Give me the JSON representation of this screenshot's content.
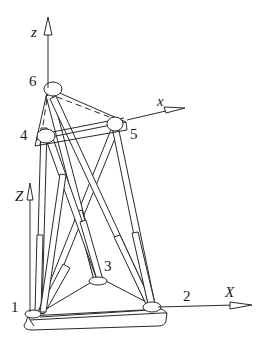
{
  "diagram": {
    "type": "hexapod parallel mechanism (Stewart platform)",
    "axes": {
      "moving_z": "z",
      "moving_x": "x",
      "base_z": "Z",
      "base_x": "X"
    },
    "joints": {
      "j1": "1",
      "j2": "2",
      "j3": "3",
      "j4": "4",
      "j5": "5",
      "j6": "6"
    },
    "colors": {
      "stroke": "#2a2a2a",
      "background": "#ffffff"
    }
  }
}
